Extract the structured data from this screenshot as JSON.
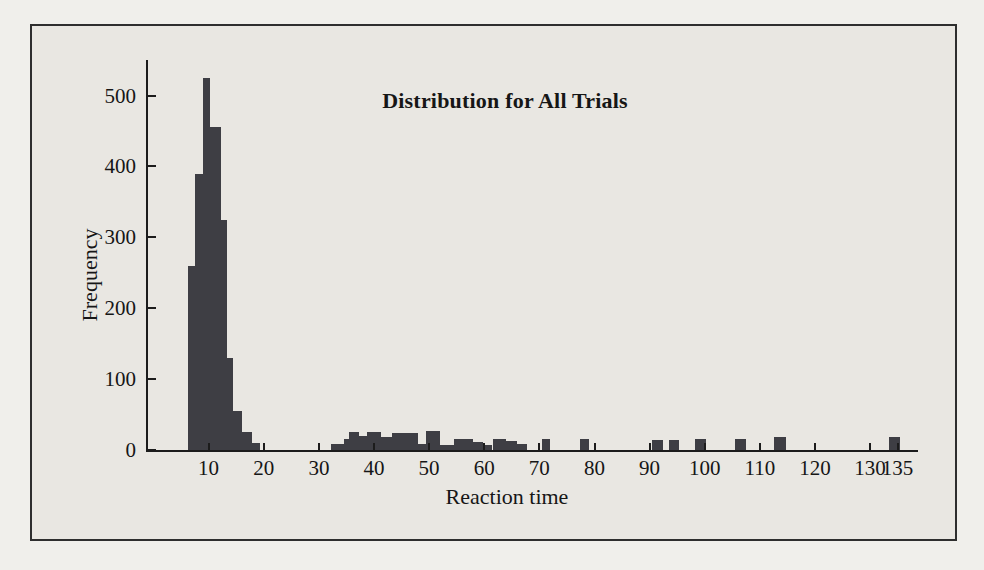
{
  "figure": {
    "kind": "scanned textbook histogram",
    "paper_color": "#e9e7e2",
    "frame_border_color": "#2e2e2e"
  },
  "chart_data": {
    "type": "bar",
    "title": "Distribution for All Trials",
    "xlabel": "Reaction time",
    "ylabel": "Frequency",
    "xlim": [
      -1,
      138.7
    ],
    "ylim": [
      0,
      550
    ],
    "x_ticks": [
      10,
      20,
      30,
      40,
      50,
      60,
      70,
      80,
      90,
      100,
      110,
      120,
      130,
      135
    ],
    "y_ticks": [
      0,
      100,
      200,
      300,
      400,
      500
    ],
    "grid": false,
    "legend": "none",
    "colors": {
      "bar": "#3e3e44",
      "axis": "#1c1c1c",
      "text": "#161616"
    },
    "bars": [
      {
        "x0": 6.2,
        "x1": 7.6,
        "f": 260
      },
      {
        "x0": 7.6,
        "x1": 8.9,
        "f": 390
      },
      {
        "x0": 8.9,
        "x1": 10.2,
        "f": 525
      },
      {
        "x0": 10.2,
        "x1": 12.2,
        "f": 455
      },
      {
        "x0": 12.2,
        "x1": 13.4,
        "f": 325
      },
      {
        "x0": 13.4,
        "x1": 14.5,
        "f": 130
      },
      {
        "x0": 14.5,
        "x1": 16.1,
        "f": 55
      },
      {
        "x0": 16.1,
        "x1": 17.9,
        "f": 25
      },
      {
        "x0": 17.9,
        "x1": 19.4,
        "f": 10
      },
      {
        "x0": 32.2,
        "x1": 34.6,
        "f": 8
      },
      {
        "x0": 34.6,
        "x1": 35.5,
        "f": 15
      },
      {
        "x0": 35.5,
        "x1": 37.3,
        "f": 25
      },
      {
        "x0": 37.3,
        "x1": 38.7,
        "f": 20
      },
      {
        "x0": 38.7,
        "x1": 41.2,
        "f": 25
      },
      {
        "x0": 41.2,
        "x1": 43.2,
        "f": 18
      },
      {
        "x0": 43.2,
        "x1": 48.0,
        "f": 24
      },
      {
        "x0": 48.0,
        "x1": 49.5,
        "f": 8
      },
      {
        "x0": 49.5,
        "x1": 52.0,
        "f": 27
      },
      {
        "x0": 52.0,
        "x1": 54.5,
        "f": 7
      },
      {
        "x0": 54.5,
        "x1": 58.0,
        "f": 15
      },
      {
        "x0": 58.0,
        "x1": 59.8,
        "f": 11
      },
      {
        "x0": 59.8,
        "x1": 61.5,
        "f": 7
      },
      {
        "x0": 61.5,
        "x1": 64.0,
        "f": 16
      },
      {
        "x0": 64.0,
        "x1": 66.0,
        "f": 13
      },
      {
        "x0": 66.0,
        "x1": 67.8,
        "f": 8
      },
      {
        "x0": 70.5,
        "x1": 72.0,
        "f": 16
      },
      {
        "x0": 77.3,
        "x1": 79.0,
        "f": 15
      },
      {
        "x0": 90.5,
        "x1": 92.5,
        "f": 14
      },
      {
        "x0": 93.5,
        "x1": 95.3,
        "f": 14
      },
      {
        "x0": 98.3,
        "x1": 100.3,
        "f": 16
      },
      {
        "x0": 105.5,
        "x1": 107.5,
        "f": 16
      },
      {
        "x0": 112.5,
        "x1": 114.8,
        "f": 18
      },
      {
        "x0": 133.5,
        "x1": 135.5,
        "f": 18
      }
    ]
  }
}
